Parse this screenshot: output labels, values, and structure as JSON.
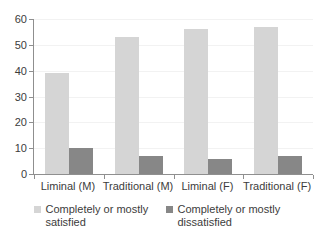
{
  "chart_data": {
    "type": "bar",
    "title": "",
    "subtitle": "",
    "xlabel": "",
    "ylabel": "",
    "ylim": [
      0,
      60
    ],
    "ytick_step": 10,
    "yticks": [
      "60",
      "50",
      "40",
      "30",
      "20",
      "10",
      "0"
    ],
    "grid": true,
    "legend_position": "bottom",
    "categories": [
      "Liminal (M)",
      "Traditional (M)",
      "Liminal (F)",
      "Traditional (F)"
    ],
    "series": [
      {
        "name": "Completely or mostly satisfied",
        "color": "#d5d5d5",
        "values": [
          39,
          53,
          56,
          57
        ]
      },
      {
        "name": "Completely or mostly dissatisfied",
        "color": "#878787",
        "values": [
          10,
          7,
          6,
          7
        ]
      }
    ]
  },
  "legend": {
    "items": [
      {
        "label": "Completely or mostly satisfied",
        "swatch": "legend-swatch-light"
      },
      {
        "label": "Completely or mostly dissatisfied",
        "swatch": "legend-swatch-dark"
      }
    ]
  },
  "colors": {
    "satisfied": "#d5d5d5",
    "dissatisfied": "#878787",
    "axis": "#8f8f8f",
    "gridline": "#f2f2f2",
    "text": "#3c3c3c",
    "background": "#ffffff"
  }
}
